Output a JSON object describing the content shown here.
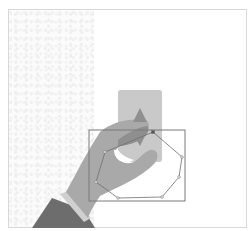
{
  "canvas": {
    "description": "Image annotation canvas showing an illustration of a hand holding a card",
    "background_color": "#ffffff",
    "border_color": "#d8d8d8"
  },
  "illustration": {
    "card_color": "#c9c9c9",
    "hand_color": "#a9a9a9",
    "thumb_color": "#8f8f8f",
    "cuff_color": "#d0d0d0",
    "sleeve_color": "#6d6d6d"
  },
  "annotations": {
    "bounding_box": {
      "x": 89,
      "y": 130,
      "width": 96,
      "height": 71,
      "stroke": "#7a7a7a"
    },
    "polygon": {
      "stroke": "#6e6e6e",
      "points": [
        [
          153,
          132
        ],
        [
          182,
          157
        ],
        [
          179,
          177
        ],
        [
          162,
          197
        ],
        [
          118,
          198
        ],
        [
          96,
          182
        ],
        [
          105,
          152
        ]
      ]
    }
  }
}
